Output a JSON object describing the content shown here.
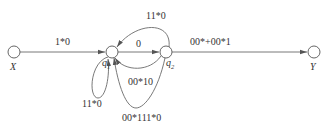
{
  "diagram": {
    "type": "state-transition-graph",
    "nodes": [
      {
        "id": "X",
        "label": "X",
        "sub": ""
      },
      {
        "id": "q1",
        "label": "q",
        "sub": "1"
      },
      {
        "id": "q2",
        "label": "q",
        "sub": "2"
      },
      {
        "id": "Y",
        "label": "Y",
        "sub": ""
      }
    ],
    "edges": [
      {
        "from": "X",
        "to": "q1",
        "label": "1*0"
      },
      {
        "from": "q1",
        "to": "q2",
        "label": "0"
      },
      {
        "from": "q2",
        "to": "q1",
        "label": "11*0",
        "route": "upper arc"
      },
      {
        "from": "q2",
        "to": "q1",
        "label": "00*10",
        "route": "lower inner arc"
      },
      {
        "from": "q2",
        "to": "q1",
        "label": "00*111*0",
        "route": "lower outer arc"
      },
      {
        "from": "q1",
        "to": "q1",
        "label": "11*0",
        "route": "self-loop"
      },
      {
        "from": "q2",
        "to": "Y",
        "label": "00*+00*1"
      }
    ]
  },
  "colors": {
    "stroke": "#6a6a6a",
    "text": "#333333",
    "background": "#ffffff"
  }
}
